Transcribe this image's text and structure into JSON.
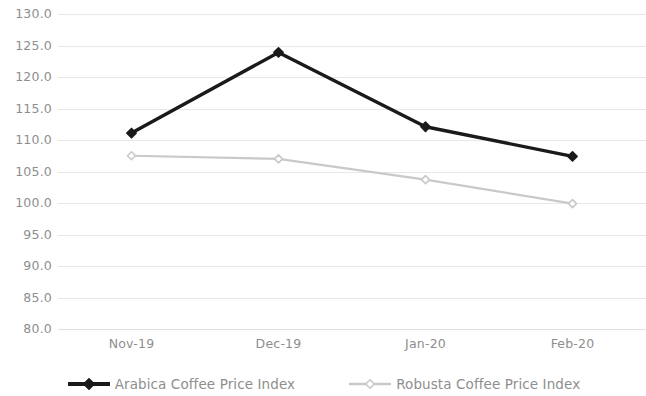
{
  "chart_data": {
    "type": "line",
    "title": "",
    "subtitle": "",
    "xlabel": "",
    "ylabel": "",
    "categories": [
      "Nov-19",
      "Dec-19",
      "Jan-20",
      "Feb-20"
    ],
    "series": [
      {
        "name": "Arabica Coffee Price Index",
        "color": "#1a1a1a",
        "marker": "diamond",
        "values": [
          111.1,
          123.9,
          112.1,
          107.4
        ]
      },
      {
        "name": "Robusta Coffee Price Index",
        "color": "#c9c9c9",
        "marker": "diamond",
        "values": [
          107.5,
          107.0,
          103.7,
          99.9
        ]
      }
    ],
    "ylim": [
      80.0,
      130.0
    ],
    "ytick_step": 5.0,
    "ytick_labels": [
      "130.0",
      "125.0",
      "120.0",
      "115.0",
      "110.0",
      "105.0",
      "100.0",
      "95.0",
      "90.0",
      "85.0",
      "80.0"
    ],
    "ytick_values": [
      130.0,
      125.0,
      120.0,
      115.0,
      110.0,
      105.0,
      100.0,
      95.0,
      90.0,
      85.0,
      80.0
    ],
    "grid": true,
    "grid_axis": "y",
    "grid_color": "#e8e8e8",
    "legend_position": "bottom",
    "background": "#ffffff",
    "axis_label_color": "#8e8e8e"
  },
  "legend": {
    "entries": [
      {
        "label": "Arabica Coffee Price Index"
      },
      {
        "label": "Robusta Coffee Price Index"
      }
    ]
  }
}
